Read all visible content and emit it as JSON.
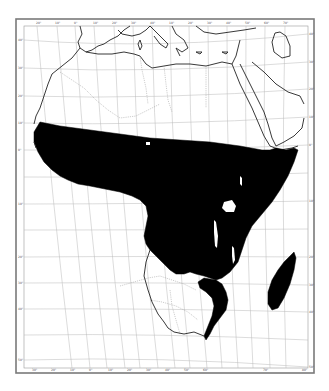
{
  "map": {
    "subject": "Africa",
    "theme": "distribution range (shaded black)",
    "projection_style": "curved graticule",
    "colors": {
      "range_fill": "#000000",
      "background": "#ffffff",
      "graticule": "#b8b8b8",
      "coastline": "#222222",
      "frame": "#7a7a7a"
    },
    "top_tick_labels": [
      "20°",
      "10°",
      "0°",
      "10°",
      "20°",
      "30°",
      "40°",
      "10°",
      "20°",
      "30°",
      "40°",
      "50°",
      "60°",
      "70°"
    ],
    "bottom_tick_labels": [
      "30°",
      "20°",
      "10°",
      "0°",
      "10°",
      "20°",
      "30°",
      "40°",
      "50°",
      "60°",
      "70°",
      "80°"
    ],
    "left_tick_labels": [
      "40°",
      "30°",
      "20°",
      "10°",
      "0°",
      "10°",
      "20°",
      "30°",
      "40°",
      "50°"
    ],
    "right_tick_labels": [
      "40°",
      "30°",
      "20°",
      "10°",
      "0°",
      "10°",
      "20°",
      "30°",
      "40°",
      "50°"
    ],
    "regions": {
      "shaded": "Sub-Saharan Africa (west, central, east, southeast coast) and Madagascar",
      "unshaded": "North Africa, Arabian Peninsula, southwestern Africa"
    }
  }
}
